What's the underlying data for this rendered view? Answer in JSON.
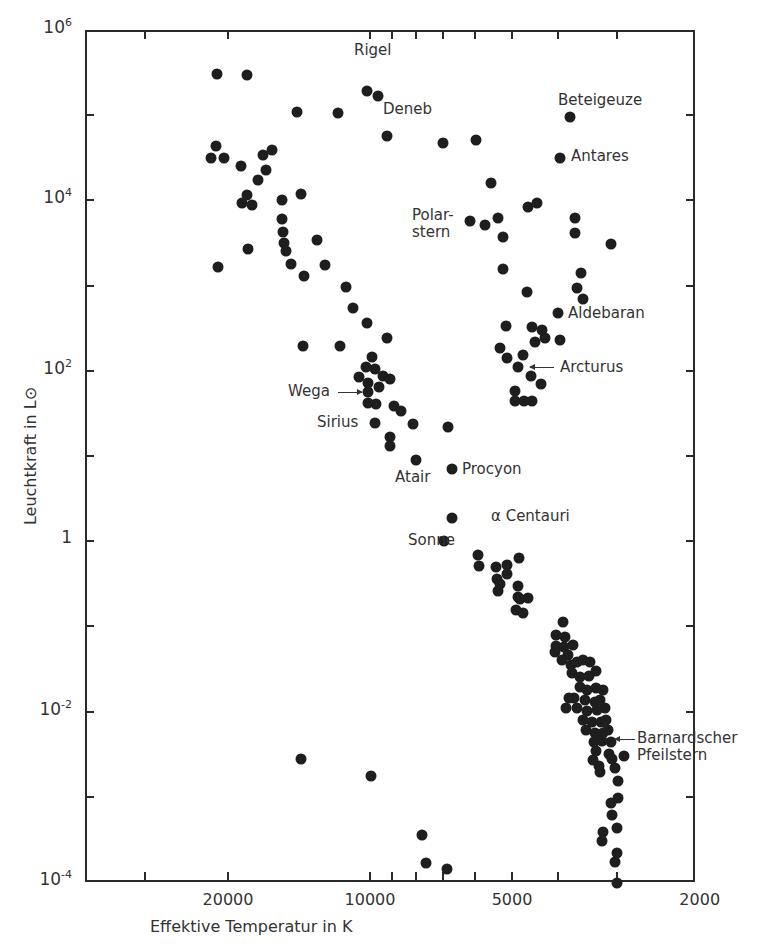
{
  "chart_data": {
    "type": "scatter",
    "title": "",
    "xlabel": "Effektive Temperatur in K",
    "ylabel": "Leuchtkraft in L⊙",
    "x_scale": "log",
    "y_scale": "log",
    "x_reversed": true,
    "xlim": [
      40000,
      2000
    ],
    "ylim": [
      0.0001,
      1000000
    ],
    "x_ticks": [
      20000,
      10000,
      5000,
      2000
    ],
    "x_tick_labels": [
      "20000",
      "10000",
      "5000",
      "2000"
    ],
    "y_ticks": [
      1000000,
      10000,
      100,
      1,
      0.01,
      0.0001
    ],
    "y_tick_labels": [
      {
        "base": "10",
        "exp": "6"
      },
      {
        "base": "10",
        "exp": "4"
      },
      {
        "base": "10",
        "exp": "2"
      },
      {
        "base": "1",
        "exp": ""
      },
      {
        "base": "10",
        "exp": "-2"
      },
      {
        "base": "10",
        "exp": "-4"
      }
    ],
    "grid": false,
    "legend": null,
    "annotations": [
      {
        "label": "Rigel",
        "T": 10000,
        "L": 180000
      },
      {
        "label": "Deneb",
        "T": 9600,
        "L": 160000
      },
      {
        "label": "Beteigeuze",
        "T": 3900,
        "L": 90000
      },
      {
        "label": "Antares",
        "T": 4100,
        "L": 30000
      },
      {
        "label": "Polar-\nstern",
        "T": 6600,
        "L": 6000
      },
      {
        "label": "Aldebaran",
        "T": 4100,
        "L": 450
      },
      {
        "label": "Arcturus",
        "T": 4700,
        "L": 110
      },
      {
        "label": "Wega",
        "T": 10000,
        "L": 50
      },
      {
        "label": "Sirius",
        "T": 9800,
        "L": 25
      },
      {
        "label": "Atair",
        "T": 8000,
        "L": 9
      },
      {
        "label": "Procyon",
        "T": 6700,
        "L": 7
      },
      {
        "label": "α Centauri",
        "T": 5900,
        "L": 1.9
      },
      {
        "label": "Sonne",
        "T": 6000,
        "L": 1.0
      },
      {
        "label": "Barnardscher\nPfeilstern",
        "T": 3100,
        "L": 0.004
      }
    ],
    "points_px": [
      [
        217,
        74
      ],
      [
        247,
        75
      ],
      [
        297,
        112
      ],
      [
        338,
        113
      ],
      [
        367,
        91
      ],
      [
        378,
        96
      ],
      [
        387,
        136
      ],
      [
        443,
        143
      ],
      [
        476,
        140
      ],
      [
        570,
        117
      ],
      [
        560,
        158
      ],
      [
        216,
        146
      ],
      [
        211,
        158
      ],
      [
        224,
        158
      ],
      [
        241,
        166
      ],
      [
        263,
        155
      ],
      [
        272,
        150
      ],
      [
        266,
        170
      ],
      [
        258,
        180
      ],
      [
        247,
        195
      ],
      [
        242,
        203
      ],
      [
        252,
        205
      ],
      [
        282,
        200
      ],
      [
        301,
        194
      ],
      [
        248,
        249
      ],
      [
        218,
        267
      ],
      [
        282,
        219
      ],
      [
        283,
        232
      ],
      [
        284,
        243
      ],
      [
        286,
        251
      ],
      [
        291,
        264
      ],
      [
        304,
        276
      ],
      [
        317,
        240
      ],
      [
        325,
        265
      ],
      [
        346,
        287
      ],
      [
        491,
        183
      ],
      [
        470,
        221
      ],
      [
        485,
        225
      ],
      [
        498,
        218
      ],
      [
        503,
        237
      ],
      [
        528,
        207
      ],
      [
        537,
        203
      ],
      [
        575,
        218
      ],
      [
        575,
        233
      ],
      [
        611,
        244
      ],
      [
        503,
        269
      ],
      [
        581,
        273
      ],
      [
        527,
        292
      ],
      [
        577,
        288
      ],
      [
        353,
        308
      ],
      [
        367,
        323
      ],
      [
        303,
        346
      ],
      [
        340,
        346
      ],
      [
        387,
        338
      ],
      [
        372,
        357
      ],
      [
        366,
        367
      ],
      [
        375,
        369
      ],
      [
        383,
        376
      ],
      [
        390,
        379
      ],
      [
        359,
        377
      ],
      [
        368,
        383
      ],
      [
        379,
        387
      ],
      [
        368,
        392
      ],
      [
        368,
        403
      ],
      [
        376,
        404
      ],
      [
        394,
        406
      ],
      [
        401,
        411
      ],
      [
        375,
        423
      ],
      [
        413,
        424
      ],
      [
        448,
        427
      ],
      [
        390,
        437
      ],
      [
        390,
        446
      ],
      [
        416,
        460
      ],
      [
        506,
        326
      ],
      [
        532,
        327
      ],
      [
        542,
        330
      ],
      [
        558,
        313
      ],
      [
        583,
        299
      ],
      [
        500,
        348
      ],
      [
        535,
        342
      ],
      [
        545,
        338
      ],
      [
        560,
        340
      ],
      [
        507,
        358
      ],
      [
        523,
        355
      ],
      [
        518,
        367
      ],
      [
        531,
        376
      ],
      [
        541,
        384
      ],
      [
        515,
        391
      ],
      [
        515,
        401
      ],
      [
        524,
        401
      ],
      [
        532,
        401
      ],
      [
        452,
        469
      ],
      [
        452,
        518
      ],
      [
        444,
        541
      ],
      [
        478,
        555
      ],
      [
        479,
        566
      ],
      [
        496,
        567
      ],
      [
        507,
        565
      ],
      [
        519,
        558
      ],
      [
        497,
        579
      ],
      [
        507,
        574
      ],
      [
        500,
        584
      ],
      [
        498,
        591
      ],
      [
        518,
        586
      ],
      [
        518,
        597
      ],
      [
        520,
        599
      ],
      [
        528,
        598
      ],
      [
        516,
        610
      ],
      [
        523,
        613
      ],
      [
        563,
        622
      ],
      [
        556,
        635
      ],
      [
        565,
        637
      ],
      [
        573,
        645
      ],
      [
        556,
        646
      ],
      [
        564,
        647
      ],
      [
        555,
        652
      ],
      [
        568,
        655
      ],
      [
        562,
        660
      ],
      [
        571,
        665
      ],
      [
        577,
        662
      ],
      [
        583,
        660
      ],
      [
        590,
        662
      ],
      [
        572,
        673
      ],
      [
        580,
        677
      ],
      [
        589,
        676
      ],
      [
        596,
        671
      ],
      [
        580,
        687
      ],
      [
        587,
        690
      ],
      [
        596,
        688
      ],
      [
        603,
        690
      ],
      [
        569,
        698
      ],
      [
        574,
        698
      ],
      [
        585,
        700
      ],
      [
        595,
        702
      ],
      [
        600,
        700
      ],
      [
        566,
        708
      ],
      [
        577,
        708
      ],
      [
        587,
        711
      ],
      [
        597,
        710
      ],
      [
        605,
        708
      ],
      [
        583,
        720
      ],
      [
        592,
        722
      ],
      [
        601,
        722
      ],
      [
        606,
        720
      ],
      [
        586,
        730
      ],
      [
        595,
        733
      ],
      [
        603,
        733
      ],
      [
        608,
        730
      ],
      [
        594,
        742
      ],
      [
        602,
        741
      ],
      [
        611,
        742
      ],
      [
        596,
        751
      ],
      [
        609,
        754
      ],
      [
        612,
        759
      ],
      [
        599,
        766
      ],
      [
        593,
        760
      ],
      [
        600,
        772
      ],
      [
        624,
        756
      ],
      [
        615,
        768
      ],
      [
        618,
        781
      ],
      [
        618,
        798
      ],
      [
        611,
        803
      ],
      [
        612,
        815
      ],
      [
        617,
        828
      ],
      [
        603,
        832
      ],
      [
        602,
        841
      ],
      [
        617,
        853
      ],
      [
        615,
        862
      ],
      [
        617,
        883
      ],
      [
        301,
        759
      ],
      [
        371,
        776
      ],
      [
        422,
        835
      ],
      [
        426,
        863
      ],
      [
        447,
        869
      ]
    ]
  },
  "axes": {
    "x_title": "Effektive Temperatur in K",
    "y_title": "Leuchtkraft in L⊙"
  }
}
